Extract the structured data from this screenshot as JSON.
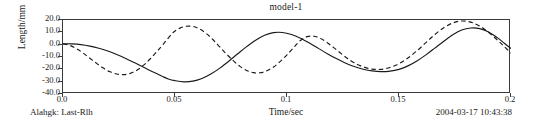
{
  "chart_data": {
    "type": "line",
    "title": "model-1",
    "xlabel": "Time/sec",
    "ylabel": "Length/mm",
    "xlim": [
      0.0,
      0.2
    ],
    "ylim": [
      -40.0,
      20.0
    ],
    "grid": false,
    "legend": "none",
    "x_ticks": [
      "0.0",
      "0.05",
      "0.1",
      "0.15",
      "0.2"
    ],
    "x_tick_values": [
      0.0,
      0.05,
      0.1,
      0.15,
      0.2
    ],
    "y_ticks": [
      "20.0",
      "10.0",
      "0.0",
      "-10.0",
      "-20.0",
      "-30.0",
      "-40.0"
    ],
    "y_tick_values": [
      20.0,
      10.0,
      0.0,
      -10.0,
      -20.0,
      -30.0,
      -40.0
    ],
    "series": [
      {
        "name": "solid",
        "style": "solid",
        "color": "#1a1a1a",
        "x": [
          0.0,
          0.004,
          0.008,
          0.012,
          0.016,
          0.02,
          0.024,
          0.028,
          0.032,
          0.036,
          0.04,
          0.044,
          0.047,
          0.05,
          0.054,
          0.058,
          0.062,
          0.066,
          0.07,
          0.074,
          0.078,
          0.082,
          0.086,
          0.09,
          0.094,
          0.098,
          0.102,
          0.106,
          0.11,
          0.114,
          0.118,
          0.122,
          0.126,
          0.13,
          0.134,
          0.138,
          0.142,
          0.146,
          0.15,
          0.154,
          0.158,
          0.162,
          0.166,
          0.17,
          0.174,
          0.178,
          0.182,
          0.186,
          0.19,
          0.194,
          0.197,
          0.2
        ],
        "y": [
          0.8,
          0.6,
          0.0,
          -1.2,
          -2.9,
          -5.2,
          -8.0,
          -11.2,
          -14.7,
          -18.3,
          -22.0,
          -25.4,
          -27.8,
          -29.2,
          -30.2,
          -29.6,
          -27.4,
          -23.8,
          -19.0,
          -13.4,
          -7.4,
          -1.6,
          3.6,
          7.6,
          9.8,
          9.9,
          8.2,
          5.2,
          1.3,
          -3.0,
          -7.3,
          -11.3,
          -14.8,
          -17.7,
          -19.9,
          -21.3,
          -21.9,
          -21.5,
          -20.0,
          -17.2,
          -13.2,
          -8.3,
          -2.8,
          2.8,
          8.0,
          11.9,
          13.5,
          13.0,
          10.2,
          5.5,
          1.2,
          -3.2
        ]
      },
      {
        "name": "dashed",
        "style": "dashed",
        "color": "#1a1a1a",
        "x": [
          0.0,
          0.003,
          0.006,
          0.009,
          0.012,
          0.015,
          0.018,
          0.021,
          0.024,
          0.027,
          0.03,
          0.033,
          0.036,
          0.039,
          0.042,
          0.045,
          0.049,
          0.052,
          0.055,
          0.058,
          0.061,
          0.064,
          0.067,
          0.07,
          0.073,
          0.076,
          0.079,
          0.082,
          0.085,
          0.088,
          0.091,
          0.094,
          0.097,
          0.1,
          0.103,
          0.106,
          0.109,
          0.112,
          0.115,
          0.118,
          0.121,
          0.124,
          0.127,
          0.13,
          0.134,
          0.138,
          0.142,
          0.146,
          0.15,
          0.154,
          0.158,
          0.162,
          0.166,
          0.17,
          0.174,
          0.178,
          0.182,
          0.186,
          0.19,
          0.194,
          0.197,
          0.2
        ],
        "y": [
          0.6,
          -0.6,
          -3.2,
          -6.8,
          -11.0,
          -15.2,
          -19.0,
          -22.0,
          -23.8,
          -24.3,
          -23.3,
          -20.7,
          -16.6,
          -11.4,
          -5.4,
          0.9,
          9.6,
          13.2,
          14.9,
          14.8,
          12.7,
          9.0,
          4.0,
          -1.8,
          -7.6,
          -13.0,
          -17.6,
          -20.9,
          -22.7,
          -22.8,
          -21.2,
          -18.1,
          -13.6,
          -8.2,
          -2.3,
          3.4,
          6.5,
          6.8,
          5.0,
          1.6,
          -2.6,
          -7.0,
          -11.2,
          -14.7,
          -18.0,
          -19.8,
          -20.0,
          -18.5,
          -15.4,
          -10.8,
          -5.0,
          1.6,
          8.2,
          13.8,
          17.6,
          19.2,
          18.3,
          15.1,
          10.0,
          3.6,
          -1.6,
          -6.8
        ]
      }
    ]
  },
  "footer": {
    "left": "Alahgk: Last-Rlh",
    "right": "2004-03-17 10:43:38"
  }
}
